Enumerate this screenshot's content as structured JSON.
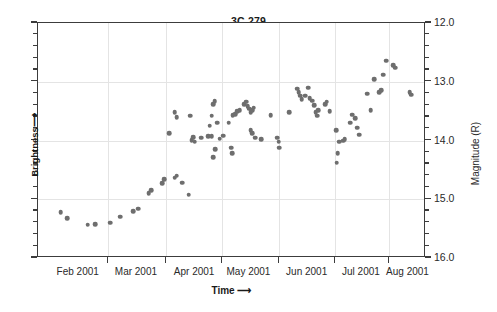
{
  "chart_data": {
    "type": "scatter",
    "title": "3C 279",
    "xlabel": "Time",
    "ylabel_left": "Brightness",
    "ylabel_right": "Magnitude (R)",
    "xlabel_arrow": "⟶",
    "ylabel_left_arrow": "⟶",
    "grid": true,
    "legend": "none",
    "point_color": "#6e6e6e",
    "axis_color": "#3c3c3c",
    "grid_color": "#e4e4e4",
    "xlim": [
      "2001-01-16",
      "2001-08-15"
    ],
    "ylim": [
      12.0,
      16.0
    ],
    "y_axis_inverted": true,
    "x_tick_labels": [
      "Feb 2001",
      "Mar 2001",
      "Apr 2001",
      "May 2001",
      "Jun 2001",
      "Jul 2001",
      "Aug 2001"
    ],
    "x_tick_label_positions_frac": [
      0.105,
      0.255,
      0.405,
      0.545,
      0.695,
      0.835,
      0.955
    ],
    "x_gridline_positions_frac": [
      0.18,
      0.33,
      0.475,
      0.62,
      0.765,
      0.905
    ],
    "y_tick_labels": [
      "12.0",
      "13.0",
      "14.0",
      "15.0",
      "16.0"
    ],
    "y_tick_values": [
      12.0,
      13.0,
      14.0,
      15.0,
      16.0
    ],
    "y_minor_tick_step": 0.2,
    "x_label": "Time",
    "y_label": "Magnitude (R)",
    "points": [
      {
        "x": 0.058,
        "mag": 15.22
      },
      {
        "x": 0.075,
        "mag": 15.32
      },
      {
        "x": 0.128,
        "mag": 15.43
      },
      {
        "x": 0.148,
        "mag": 15.42
      },
      {
        "x": 0.186,
        "mag": 15.4
      },
      {
        "x": 0.212,
        "mag": 15.3
      },
      {
        "x": 0.245,
        "mag": 15.2
      },
      {
        "x": 0.258,
        "mag": 15.16
      },
      {
        "x": 0.285,
        "mag": 14.9
      },
      {
        "x": 0.291,
        "mag": 14.85
      },
      {
        "x": 0.32,
        "mag": 14.73
      },
      {
        "x": 0.326,
        "mag": 14.66
      },
      {
        "x": 0.352,
        "mag": 14.63
      },
      {
        "x": 0.358,
        "mag": 14.6
      },
      {
        "x": 0.372,
        "mag": 14.72
      },
      {
        "x": 0.388,
        "mag": 14.92
      },
      {
        "x": 0.338,
        "mag": 13.88
      },
      {
        "x": 0.352,
        "mag": 13.52
      },
      {
        "x": 0.358,
        "mag": 13.6
      },
      {
        "x": 0.392,
        "mag": 13.58
      },
      {
        "x": 0.396,
        "mag": 13.99
      },
      {
        "x": 0.4,
        "mag": 13.94
      },
      {
        "x": 0.404,
        "mag": 14.02
      },
      {
        "x": 0.42,
        "mag": 13.95
      },
      {
        "x": 0.438,
        "mag": 13.93
      },
      {
        "x": 0.448,
        "mag": 13.93
      },
      {
        "x": 0.443,
        "mag": 13.75
      },
      {
        "x": 0.448,
        "mag": 13.58
      },
      {
        "x": 0.452,
        "mag": 13.38
      },
      {
        "x": 0.455,
        "mag": 13.33
      },
      {
        "x": 0.462,
        "mag": 13.7
      },
      {
        "x": 0.468,
        "mag": 13.97
      },
      {
        "x": 0.456,
        "mag": 14.15
      },
      {
        "x": 0.452,
        "mag": 14.28
      },
      {
        "x": 0.478,
        "mag": 13.92
      },
      {
        "x": 0.492,
        "mag": 13.7
      },
      {
        "x": 0.502,
        "mag": 13.57
      },
      {
        "x": 0.508,
        "mag": 13.55
      },
      {
        "x": 0.514,
        "mag": 13.5
      },
      {
        "x": 0.52,
        "mag": 13.48
      },
      {
        "x": 0.498,
        "mag": 14.12
      },
      {
        "x": 0.5,
        "mag": 14.22
      },
      {
        "x": 0.532,
        "mag": 13.38
      },
      {
        "x": 0.536,
        "mag": 13.34
      },
      {
        "x": 0.54,
        "mag": 13.42
      },
      {
        "x": 0.544,
        "mag": 13.46
      },
      {
        "x": 0.548,
        "mag": 13.52
      },
      {
        "x": 0.552,
        "mag": 13.48
      },
      {
        "x": 0.556,
        "mag": 13.44
      },
      {
        "x": 0.548,
        "mag": 13.82
      },
      {
        "x": 0.552,
        "mag": 13.88
      },
      {
        "x": 0.56,
        "mag": 13.95
      },
      {
        "x": 0.576,
        "mag": 13.98
      },
      {
        "x": 0.6,
        "mag": 13.57
      },
      {
        "x": 0.616,
        "mag": 13.95
      },
      {
        "x": 0.62,
        "mag": 14.02
      },
      {
        "x": 0.622,
        "mag": 14.12
      },
      {
        "x": 0.648,
        "mag": 13.52
      },
      {
        "x": 0.668,
        "mag": 13.12
      },
      {
        "x": 0.672,
        "mag": 13.18
      },
      {
        "x": 0.676,
        "mag": 13.24
      },
      {
        "x": 0.68,
        "mag": 13.3
      },
      {
        "x": 0.688,
        "mag": 13.24
      },
      {
        "x": 0.696,
        "mag": 13.1
      },
      {
        "x": 0.7,
        "mag": 13.28
      },
      {
        "x": 0.706,
        "mag": 13.32
      },
      {
        "x": 0.712,
        "mag": 13.4
      },
      {
        "x": 0.716,
        "mag": 13.52
      },
      {
        "x": 0.72,
        "mag": 13.58
      },
      {
        "x": 0.722,
        "mag": 13.48
      },
      {
        "x": 0.74,
        "mag": 13.38
      },
      {
        "x": 0.744,
        "mag": 13.34
      },
      {
        "x": 0.752,
        "mag": 13.5
      },
      {
        "x": 0.768,
        "mag": 13.82
      },
      {
        "x": 0.776,
        "mag": 14.02
      },
      {
        "x": 0.786,
        "mag": 14.0
      },
      {
        "x": 0.79,
        "mag": 13.98
      },
      {
        "x": 0.772,
        "mag": 14.22
      },
      {
        "x": 0.77,
        "mag": 14.38
      },
      {
        "x": 0.804,
        "mag": 13.7
      },
      {
        "x": 0.81,
        "mag": 13.56
      },
      {
        "x": 0.818,
        "mag": 13.62
      },
      {
        "x": 0.822,
        "mag": 13.78
      },
      {
        "x": 0.828,
        "mag": 13.9
      },
      {
        "x": 0.848,
        "mag": 13.2
      },
      {
        "x": 0.858,
        "mag": 13.48
      },
      {
        "x": 0.866,
        "mag": 12.96
      },
      {
        "x": 0.88,
        "mag": 13.18
      },
      {
        "x": 0.884,
        "mag": 13.14
      },
      {
        "x": 0.89,
        "mag": 12.88
      },
      {
        "x": 0.898,
        "mag": 12.64
      },
      {
        "x": 0.916,
        "mag": 12.72
      },
      {
        "x": 0.92,
        "mag": 12.76
      },
      {
        "x": 0.958,
        "mag": 13.18
      },
      {
        "x": 0.962,
        "mag": 13.22
      }
    ]
  }
}
